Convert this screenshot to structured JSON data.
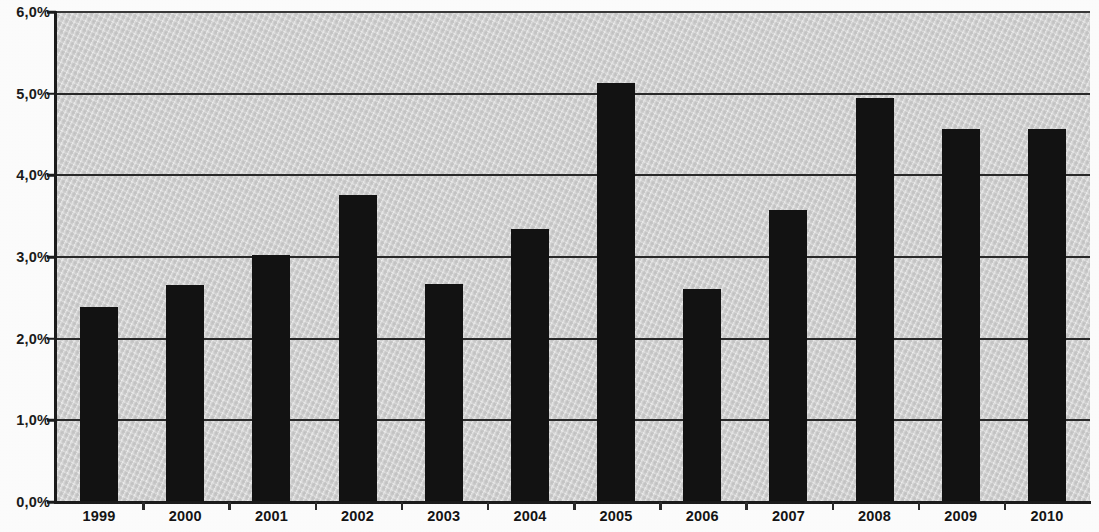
{
  "chart_data": {
    "type": "bar",
    "title": "",
    "xlabel": "",
    "ylabel": "",
    "categories": [
      "1999",
      "2000",
      "2001",
      "2002",
      "2003",
      "2004",
      "2005",
      "2006",
      "2007",
      "2008",
      "2009",
      "2010"
    ],
    "values": [
      2.39,
      2.66,
      3.03,
      3.76,
      2.67,
      3.34,
      5.13,
      2.61,
      3.57,
      4.95,
      4.57,
      4.57
    ],
    "value_unit": "%",
    "ylim": [
      0.0,
      6.0
    ],
    "ytick_values": [
      0.0,
      1.0,
      2.0,
      3.0,
      4.0,
      5.0,
      6.0
    ],
    "ytick_labels": [
      "0,0%",
      "1,0%",
      "2,0%",
      "3,0%",
      "4,0%",
      "5,0%",
      "6,0%"
    ],
    "grid": true,
    "grid_axis": "y",
    "legend": false,
    "legend_position": "none",
    "bar_color": "#121212",
    "plot_background_color": "#d2d2d2",
    "axis_color": "#1c1c1c",
    "gridline_color": "#2a2a2a",
    "series": [
      {
        "name": "",
        "values": [
          2.39,
          2.66,
          3.03,
          3.76,
          2.67,
          3.34,
          5.13,
          2.61,
          3.57,
          4.95,
          4.57,
          4.57
        ]
      }
    ]
  }
}
